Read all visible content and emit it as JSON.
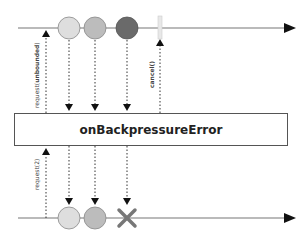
{
  "operator": {
    "name": "onBackpressureError"
  },
  "upstream": {
    "items": [
      {
        "id": 1,
        "color": "#dedede",
        "x": 69
      },
      {
        "id": 2,
        "color": "#bcbcbc",
        "x": 95
      },
      {
        "id": 3,
        "color": "#6a6a6a",
        "x": 127
      }
    ],
    "cancel_marker_x": 160,
    "request_label_prefix": "request(",
    "request_label_bold": "unbounded",
    "request_label_suffix": ")",
    "cancel_label": "cancel()"
  },
  "downstream": {
    "items": [
      {
        "id": 1,
        "color": "#dedede",
        "x": 69
      },
      {
        "id": 2,
        "color": "#bcbcbc",
        "x": 95
      }
    ],
    "error_marker_x": 127,
    "request_label": "request(2)"
  },
  "colors": {
    "line": "#777777",
    "arrowhead": "#111111",
    "error_x": "#777777"
  }
}
